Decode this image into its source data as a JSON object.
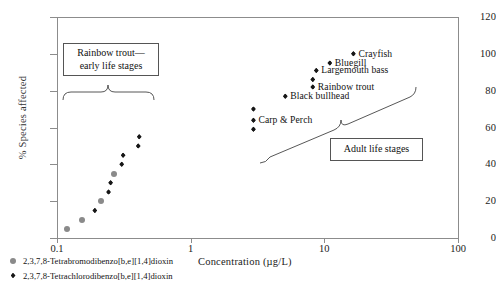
{
  "chart_data": {
    "type": "scatter",
    "title": "",
    "xlabel": "Concentration (µg/L)",
    "ylabel": "% Species affected",
    "xscale": "log",
    "xlim": [
      0.1,
      100
    ],
    "ylim": [
      0,
      120
    ],
    "xticks": [
      0.1,
      1,
      10,
      100
    ],
    "xtick_labels": [
      "0.1",
      "1",
      "10",
      "100"
    ],
    "yticks": [
      0,
      20,
      40,
      60,
      80,
      100,
      120
    ],
    "ytick_labels": [
      "0",
      "20",
      "40",
      "60",
      "80",
      "100",
      "120"
    ],
    "grid": false,
    "legend_position": "below-left",
    "series": [
      {
        "name": "2,3,7,8-Tetrabromodibenzo[b,e][1,4]dioxin",
        "marker": "circle",
        "color": "#8a8a8a",
        "points": [
          {
            "x": 0.118,
            "y": 5
          },
          {
            "x": 0.153,
            "y": 10
          },
          {
            "x": 0.215,
            "y": 20
          },
          {
            "x": 0.268,
            "y": 35
          }
        ]
      },
      {
        "name": "2,3,7,8-Tetrachlorodibenzo[b,e][1,4]dioxin",
        "marker": "diamond",
        "color": "#171717",
        "points": [
          {
            "x": 0.192,
            "y": 15
          },
          {
            "x": 0.243,
            "y": 25
          },
          {
            "x": 0.252,
            "y": 30
          },
          {
            "x": 0.305,
            "y": 40
          },
          {
            "x": 0.312,
            "y": 45
          },
          {
            "x": 0.405,
            "y": 50
          },
          {
            "x": 0.412,
            "y": 55
          },
          {
            "x": 2.95,
            "y": 70
          },
          {
            "x": 2.95,
            "y": 64
          },
          {
            "x": 2.95,
            "y": 59
          },
          {
            "x": 5.1,
            "y": 77
          },
          {
            "x": 8.2,
            "y": 82
          },
          {
            "x": 8.2,
            "y": 86
          },
          {
            "x": 8.7,
            "y": 91
          },
          {
            "x": 11.0,
            "y": 95
          },
          {
            "x": 16.5,
            "y": 100
          }
        ]
      }
    ],
    "point_labels": [
      {
        "text": "Crayfish",
        "x": 16.5,
        "y": 100
      },
      {
        "text": "Bluegill",
        "x": 11.0,
        "y": 95
      },
      {
        "text": "Largemouth bass",
        "x": 8.7,
        "y": 91
      },
      {
        "text": "Rainbow trout",
        "x": 8.2,
        "y": 82
      },
      {
        "text": "Black bullhead",
        "x": 5.1,
        "y": 77
      },
      {
        "text": "Carp & Perch",
        "x": 2.95,
        "y": 64
      }
    ],
    "annotations": [
      {
        "name": "early-life-stages",
        "text_line_1": "Rainbow trout—",
        "text_line_2": "early life stages"
      },
      {
        "name": "adult-life-stages",
        "text_line_1": "Adult life stages"
      }
    ]
  },
  "axes": {
    "y": {
      "title": "% Species affected",
      "ticks": [
        "120",
        "100",
        "80",
        "60",
        "40",
        "20",
        "0"
      ]
    },
    "x": {
      "title": "Concentration (µg/L)",
      "ticks": [
        "0.1",
        "1",
        "10",
        "100"
      ]
    }
  },
  "annotations": {
    "early": {
      "line1": "Rainbow trout—",
      "line2": "early life stages"
    },
    "adult": {
      "line1": "Adult life stages"
    }
  },
  "species_labels": {
    "crayfish": "Crayfish",
    "bluegill": "Bluegill",
    "largemouth_bass": "Largemouth bass",
    "rainbow_trout": "Rainbow trout",
    "black_bullhead": "Black bullhead",
    "carp_perch": "Carp & Perch"
  },
  "legend": {
    "items": [
      {
        "marker": "circle",
        "label": "2,3,7,8-Tetrabromodibenzo[b,e][1,4]dioxin",
        "color": "#8a8a8a"
      },
      {
        "marker": "diamond",
        "label": "2,3,7,8-Tetrachlorodibenzo[b,e][1,4]dioxin",
        "color": "#171717"
      }
    ]
  }
}
